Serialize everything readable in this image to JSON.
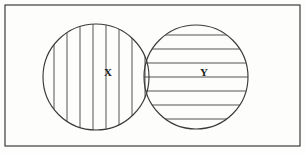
{
  "figure": {
    "kind": "venn-diagram",
    "canvas": {
      "width": 305,
      "height": 153
    },
    "background_color": "#fdfdfc",
    "line_color": "#3a3a3a",
    "hatch_color": "#4a4a4a",
    "label_color": "#1a1a1a"
  },
  "frame": {
    "name": "universal-set-rectangle",
    "x": 5,
    "y": 5,
    "width": 295,
    "height": 141,
    "stroke": "#2a2a2a"
  },
  "sets": [
    {
      "id": "X",
      "label": "X",
      "label_x": 108,
      "label_y": 73,
      "center_x": 96,
      "center_y": 77,
      "radius": 53,
      "hatch_type": "vertical",
      "hatch_spacing": 13,
      "hatch_offsets": [
        -42,
        -29,
        -16,
        -3,
        10,
        23,
        36,
        49
      ]
    },
    {
      "id": "Y",
      "label": "Y",
      "label_x": 204,
      "label_y": 73,
      "center_x": 196,
      "center_y": 77,
      "radius": 52,
      "hatch_type": "horizontal",
      "hatch_spacing": 14,
      "hatch_offsets": [
        -42,
        -28,
        -14,
        0,
        14,
        28,
        42
      ]
    }
  ],
  "regions": {
    "overlap_label": "",
    "overlap_has_both_hatches": true
  }
}
